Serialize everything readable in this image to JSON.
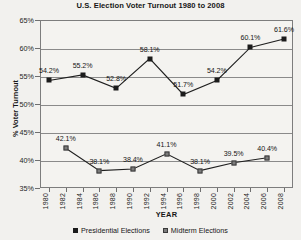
{
  "chart_data": {
    "type": "line",
    "title": "U.S. Election Voter Turnout 1980 to 2008",
    "xlabel": "YEAR",
    "ylabel": "% Voter Turnout",
    "ylim": [
      35,
      65
    ],
    "ytick_step": 5,
    "ytick_labels": [
      "65%",
      "60%",
      "55%",
      "50%",
      "45%",
      "40%",
      "35%"
    ],
    "ytick_values": [
      65,
      60,
      55,
      50,
      45,
      40,
      35
    ],
    "grid": true,
    "legend_position": "bottom",
    "x": [
      1980,
      1982,
      1984,
      1986,
      1988,
      1990,
      1992,
      1994,
      1996,
      1998,
      2000,
      2002,
      2004,
      2006,
      2008
    ],
    "xtick_labels": [
      "1980",
      "1982",
      "1984",
      "1986",
      "1988",
      "1990",
      "1992",
      "1994",
      "1996",
      "1998",
      "2000",
      "2002",
      "2004",
      "2006",
      "2008"
    ],
    "series": [
      {
        "name": "Presidential Elections",
        "color": "#1b1b1b",
        "marker": "filled-square",
        "points": [
          {
            "x": 1980,
            "y": 54.2,
            "label": "54.2%"
          },
          {
            "x": 1984,
            "y": 55.2,
            "label": "55.2%"
          },
          {
            "x": 1988,
            "y": 52.8,
            "label": "52.8%"
          },
          {
            "x": 1992,
            "y": 58.1,
            "label": "58.1%"
          },
          {
            "x": 1996,
            "y": 51.7,
            "label": "51.7%"
          },
          {
            "x": 2000,
            "y": 54.2,
            "label": "54.2%"
          },
          {
            "x": 2004,
            "y": 60.1,
            "label": "60.1%"
          },
          {
            "x": 2008,
            "y": 61.6,
            "label": "61.6%"
          }
        ]
      },
      {
        "name": "Midterm Elections",
        "color": "#7c7c7c",
        "marker": "grey-square",
        "points": [
          {
            "x": 1982,
            "y": 42.1,
            "label": "42.1%"
          },
          {
            "x": 1986,
            "y": 38.1,
            "label": "38.1%"
          },
          {
            "x": 1990,
            "y": 38.4,
            "label": "38.4%"
          },
          {
            "x": 1994,
            "y": 41.1,
            "label": "41.1%"
          },
          {
            "x": 1998,
            "y": 38.1,
            "label": "38.1%"
          },
          {
            "x": 2002,
            "y": 39.5,
            "label": "39.5%"
          },
          {
            "x": 2006,
            "y": 40.4,
            "label": "40.4%"
          }
        ]
      }
    ],
    "legend": [
      {
        "label": "Presidential Elections",
        "color": "#1b1b1b"
      },
      {
        "label": "Midterm Elections",
        "color": "#7c7c7c"
      }
    ]
  }
}
